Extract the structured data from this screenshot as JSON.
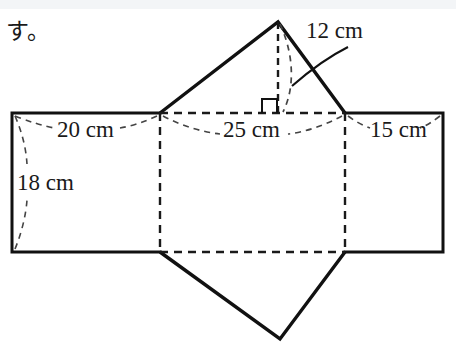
{
  "figure": {
    "kind": "geometry-net-diagram",
    "background_color": "#ffffff",
    "stroke_color": "#111111",
    "dash_color": "#333333",
    "top_band_color": "#f3f5f7"
  },
  "prompt_text": {
    "japanese_fragment": "す。"
  },
  "dimension_labels": {
    "height_12": "12 cm",
    "side_20": "20 cm",
    "base_25": "25 cm",
    "side_15": "15 cm",
    "depth_18": "18 cm"
  },
  "annotations": {
    "right_angle_marker": "right-angle-square",
    "leader_lines": "dashed-curved-leaders"
  },
  "geometry": {
    "left_rect": {
      "x": 12,
      "y": 113,
      "w": 148,
      "h": 139
    },
    "mid_rect": {
      "x": 160,
      "y": 113,
      "w": 185,
      "h": 139
    },
    "right_rect": {
      "x": 345,
      "y": 113,
      "w": 98,
      "h": 139
    },
    "top_triangle_apex": {
      "x": 278,
      "y": 22
    },
    "bottom_triangle_apex": {
      "x": 280,
      "y": 339
    },
    "altitude_foot": {
      "x": 278,
      "y": 113
    }
  }
}
